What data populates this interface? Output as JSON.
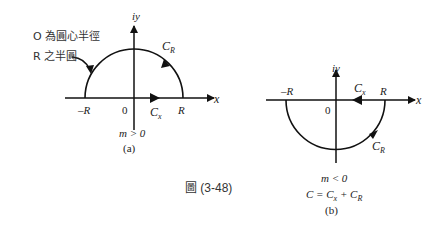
{
  "figure_caption": "圖 (3-48)",
  "panel_a": {
    "annotation_line1": "O 為圓心半徑",
    "annotation_line2": "R 之半圓",
    "y_axis_label": "iy",
    "x_axis_label": "x",
    "origin_label": "0",
    "minus_r_label": "–R",
    "r_label": "R",
    "cx_label": "C",
    "cx_sub": "x",
    "cr_label": "C",
    "cr_sub": "R",
    "condition": "m > 0",
    "panel_label": "(a)"
  },
  "panel_b": {
    "y_axis_label": "iy",
    "x_axis_label": "x",
    "origin_label": "0",
    "minus_r_label": "–R",
    "r_label": "R",
    "cx_label": "C",
    "cx_sub": "x",
    "cr_label": "C",
    "cr_sub": "R",
    "condition": "m < 0",
    "equation_c": "C = C",
    "equation_sub1": "x",
    "equation_plus": " + C",
    "equation_sub2": "R",
    "panel_label": "(b)"
  }
}
